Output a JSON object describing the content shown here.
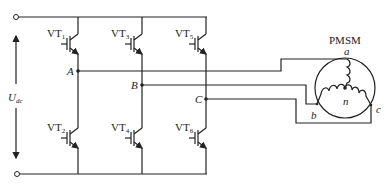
{
  "diagram": {
    "type": "three-phase inverter driving PMSM",
    "dc_source": {
      "label": "U",
      "subscript": "dc"
    },
    "switches": [
      {
        "id": "VT1",
        "label": "VT",
        "subscript": "1",
        "leg": "A",
        "position": "upper"
      },
      {
        "id": "VT3",
        "label": "VT",
        "subscript": "3",
        "leg": "B",
        "position": "upper"
      },
      {
        "id": "VT5",
        "label": "VT",
        "subscript": "5",
        "leg": "C",
        "position": "upper"
      },
      {
        "id": "VT2",
        "label": "VT",
        "subscript": "2",
        "leg": "A",
        "position": "lower"
      },
      {
        "id": "VT4",
        "label": "VT",
        "subscript": "4",
        "leg": "B",
        "position": "lower"
      },
      {
        "id": "VT6",
        "label": "VT",
        "subscript": "6",
        "leg": "C",
        "position": "lower"
      }
    ],
    "nodes": [
      {
        "label": "A"
      },
      {
        "label": "B"
      },
      {
        "label": "C"
      }
    ],
    "motor": {
      "label": "PMSM",
      "terminals": [
        "a",
        "b",
        "c"
      ],
      "neutral": "n"
    }
  }
}
